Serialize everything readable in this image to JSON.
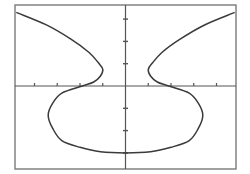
{
  "chart_data": {
    "type": "line",
    "title": "",
    "xlabel": "",
    "ylabel": "",
    "xlim": [
      -4.8,
      4.9
    ],
    "ylim": [
      -3.6,
      3.6
    ],
    "grid": false,
    "legend": null,
    "x_ticks": [
      -4,
      -3,
      -2,
      -1,
      1,
      2,
      3,
      4
    ],
    "y_ticks": [
      -3,
      -2,
      -1,
      1,
      2,
      3
    ],
    "series": [
      {
        "name": "curve",
        "color": "#3a3a3a",
        "points": [
          [
            -4.8,
            3.3
          ],
          [
            -3.5,
            2.75
          ],
          [
            -2.4,
            2.1
          ],
          [
            -1.6,
            1.5
          ],
          [
            -1.2,
            1.05
          ],
          [
            -1.0,
            0.75
          ],
          [
            -1.1,
            0.45
          ],
          [
            -1.4,
            0.18
          ],
          [
            -1.9,
            0.0
          ],
          [
            -2.8,
            -0.32
          ],
          [
            -3.2,
            -0.77
          ],
          [
            -3.4,
            -1.32
          ],
          [
            -3.2,
            -1.9
          ],
          [
            -2.8,
            -2.45
          ],
          [
            -2.0,
            -2.75
          ],
          [
            -1.1,
            -2.95
          ],
          [
            0.0,
            -3.0
          ],
          [
            1.1,
            -2.95
          ],
          [
            2.0,
            -2.75
          ],
          [
            2.8,
            -2.45
          ],
          [
            3.2,
            -1.9
          ],
          [
            3.4,
            -1.32
          ],
          [
            3.2,
            -0.77
          ],
          [
            2.8,
            -0.32
          ],
          [
            1.9,
            0.0
          ],
          [
            1.4,
            0.18
          ],
          [
            1.1,
            0.45
          ],
          [
            1.0,
            0.75
          ],
          [
            1.2,
            1.05
          ],
          [
            1.6,
            1.5
          ],
          [
            2.4,
            2.1
          ],
          [
            3.5,
            2.75
          ],
          [
            4.8,
            3.3
          ]
        ]
      }
    ]
  },
  "frame": {
    "left": 15,
    "top": 5,
    "right": 236,
    "bottom": 169
  },
  "origin_px": {
    "x": 125.5,
    "y": 86
  },
  "scale_px": {
    "x": 22.75,
    "y": 22.3
  },
  "colors": {
    "axis": "#555555",
    "frame": "#7a7a7a",
    "curve": "#3a3a3a",
    "background": "#ffffff"
  }
}
